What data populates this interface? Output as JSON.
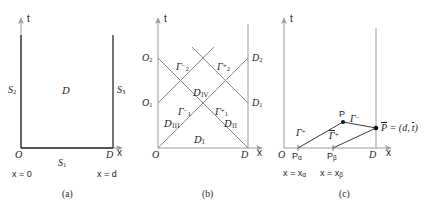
{
  "figure": {
    "type": "spacetime-characteristic-diagrams",
    "panel_count": 3,
    "stroke_dark": "#2b2b2b",
    "stroke_light": "#9a9a9a",
    "background": "#ffffff"
  },
  "panel_a": {
    "caption": "(a)",
    "axis_t": "t",
    "axis_x": "x",
    "origin_label": "O",
    "right_label": "D",
    "region_label": "D",
    "boundary_left": "S",
    "boundary_left_sub": "2",
    "boundary_right": "S",
    "boundary_right_sub": "3",
    "boundary_bottom": "S",
    "boundary_bottom_sub": "1",
    "x_left_value": "x = 0",
    "x_right_value": "x = d"
  },
  "panel_b": {
    "caption": "(b)",
    "axis_t": "t",
    "axis_x": "x",
    "origin_label": "O",
    "right_label": "D",
    "left_nodes": [
      {
        "name": "O",
        "sub": "1"
      },
      {
        "name": "O",
        "sub": "2"
      }
    ],
    "right_nodes": [
      {
        "name": "D",
        "sub": "1"
      },
      {
        "name": "D",
        "sub": "2"
      }
    ],
    "characteristics": [
      {
        "symbol": "Γ",
        "sub": "1",
        "sup": "−"
      },
      {
        "symbol": "Γ",
        "sub": "1",
        "sup": "+"
      },
      {
        "symbol": "Γ",
        "sub": "2",
        "sup": "−"
      },
      {
        "symbol": "Γ",
        "sub": "2",
        "sup": "+"
      }
    ],
    "regions": [
      {
        "symbol": "D",
        "sub": "I"
      },
      {
        "symbol": "D",
        "sub": "II"
      },
      {
        "symbol": "D",
        "sub": "III"
      },
      {
        "symbol": "D",
        "sub": "IV"
      }
    ]
  },
  "panel_c": {
    "caption": "(c)",
    "axis_t": "t",
    "axis_x": "x",
    "origin_label": "O",
    "right_label": "D",
    "point_p": "P",
    "point_p_bar": "P",
    "p_bar_equation_lhs": "P",
    "p_bar_equation": "= (d, t )",
    "p_bar_eq_d": "d",
    "p_bar_eq_t": "t",
    "node_alpha": "P",
    "node_alpha_sub": "α",
    "node_beta": "P",
    "node_beta_sub": "β",
    "x_alpha_value": "x = x",
    "x_alpha_sub": "α",
    "x_beta_value": "x = x",
    "x_beta_sub": "β",
    "gamma_plus": {
      "symbol": "Γ",
      "sup": "+"
    },
    "gamma_bar_plus": {
      "symbol": "Γ",
      "sup": "+"
    },
    "gamma_minus": {
      "symbol": "Γ",
      "sup": "−"
    }
  }
}
